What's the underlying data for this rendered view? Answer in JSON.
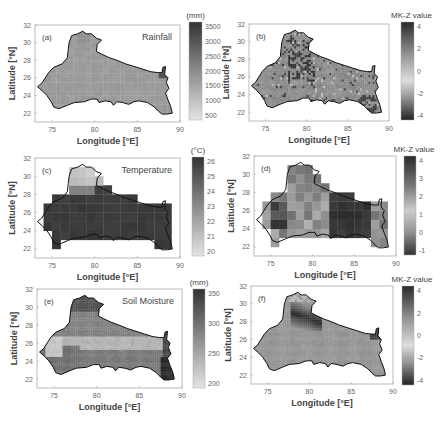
{
  "figure": {
    "layout": "3 rows x 2 columns",
    "x_ticks": [
      "75",
      "80",
      "85",
      "90"
    ],
    "y_ticks": [
      "32",
      "30",
      "28",
      "26",
      "24",
      "22"
    ],
    "xlabel": "Longitude [°E]",
    "ylabel": "Latitude [°N]"
  },
  "chart_data": [
    {
      "type": "heatmap",
      "panel": "(a)",
      "title": "Rainfall",
      "xlabel": "Longitude [°E]",
      "ylabel": "Latitude [°N]",
      "xlim": [
        73,
        90
      ],
      "ylim": [
        21,
        32
      ],
      "colorbar": {
        "label": "(mm)",
        "ticks": [
          "3500",
          "3000",
          "2500",
          "2000",
          "1500",
          "1000",
          "500"
        ],
        "range": [
          500,
          3500
        ]
      },
      "description": "Mean rainfall mostly ~1000–1500 mm across basin; higher values (~2500–3500 mm) in northeastern corner near 88°E, 27°N"
    },
    {
      "type": "heatmap",
      "panel": "(b)",
      "title": "",
      "xlabel": "Longitude [°E]",
      "ylabel": "Latitude [°N]",
      "xlim": [
        73,
        90
      ],
      "ylim": [
        21,
        32
      ],
      "colorbar": {
        "label": "MK-Z value",
        "ticks": [
          "4",
          "2",
          "0",
          "-2",
          "-4"
        ],
        "range": [
          -5,
          4.5
        ]
      },
      "description": "Rainfall trend: mostly near 0 (-1 to 1); scattered negative patches in central north (~78–81°E, 26–30°N) and southeast (~87°E, 23°N)"
    },
    {
      "type": "heatmap",
      "panel": "(c)",
      "title": "Temperature",
      "xlabel": "Longitude [°E]",
      "ylabel": "Latitude [°N]",
      "xlim": [
        73,
        90
      ],
      "ylim": [
        21,
        32
      ],
      "colorbar": {
        "label": "(°C)",
        "ticks": [
          "26",
          "25",
          "24",
          "23",
          "22",
          "21",
          "20"
        ],
        "range": [
          19.6,
          26.6
        ]
      },
      "description": "Coarse grid; ~25–26 °C across most of basin; cooler (~20–22 °C) in northern hills near 78–80°E, 29–31°N"
    },
    {
      "type": "heatmap",
      "panel": "(d)",
      "title": "",
      "xlabel": "Longitude [°E]",
      "ylabel": "Latitude [°N]",
      "xlim": [
        73,
        90
      ],
      "ylim": [
        21,
        32
      ],
      "colorbar": {
        "label": "MK-Z value",
        "ticks": [
          "4",
          "3",
          "2",
          "1",
          "0",
          "-1"
        ],
        "range": [
          -2,
          4.5
        ]
      },
      "description": "Temperature trend: strongly positive (3–4) in east (83–87°E, 23–28°N) and west (~75–77°E, 25–27°N); moderate (1–2) elsewhere"
    },
    {
      "type": "heatmap",
      "panel": "(e)",
      "title": "Soil Moisture",
      "xlabel": "Longitude [°E]",
      "ylabel": "Latitude [°N]",
      "xlim": [
        73,
        90
      ],
      "ylim": [
        21,
        32
      ],
      "colorbar": {
        "label": "(mm)",
        "ticks": [
          "350",
          "300",
          "250",
          "200"
        ],
        "range": [
          170,
          390
        ]
      },
      "description": "Higher soil moisture (300–390 mm) in northern hills and southeast corner; ~250–280 mm in south-central band; ~200 mm in west-central"
    },
    {
      "type": "heatmap",
      "panel": "(f)",
      "title": "",
      "xlabel": "Longitude [°E]",
      "ylabel": "Latitude [°N]",
      "xlim": [
        73,
        90
      ],
      "ylim": [
        21,
        32
      ],
      "colorbar": {
        "label": "MK-Z value",
        "ticks": [
          "4",
          "2",
          "0",
          "-2",
          "-4"
        ],
        "range": [
          -5.5,
          5
        ]
      },
      "description": "Soil moisture trend: mostly near 0; strongly negative (-4 to -5) band at northern foothills (~78–81°E, 27–30°N) and near 88°E, 26–27°N"
    }
  ],
  "panels": [
    {
      "id": "a",
      "letter": "(a)",
      "title": "Rainfall",
      "cb_label": "(mm)",
      "cb_ticks": [
        "3500",
        "3000",
        "2500",
        "2000",
        "1500",
        "1000",
        "500"
      ]
    },
    {
      "id": "b",
      "letter": "(b)",
      "title": "",
      "cb_label": "MK-Z value",
      "cb_ticks": [
        "4",
        "2",
        "0",
        "-2",
        "-4"
      ]
    },
    {
      "id": "c",
      "letter": "(c)",
      "title": "Temperature",
      "cb_label": "(°C)",
      "cb_ticks": [
        "26",
        "25",
        "24",
        "23",
        "22",
        "21",
        "20"
      ]
    },
    {
      "id": "d",
      "letter": "(d)",
      "title": "",
      "cb_label": "MK-Z value",
      "cb_ticks": [
        "4",
        "3",
        "2",
        "1",
        "0",
        "-1"
      ]
    },
    {
      "id": "e",
      "letter": "(e)",
      "title": "Soil Moisture",
      "cb_label": "(mm)",
      "cb_ticks": [
        "350",
        "300",
        "250",
        "200"
      ]
    },
    {
      "id": "f",
      "letter": "(f)",
      "title": "",
      "cb_label": "MK-Z value",
      "cb_ticks": [
        "4",
        "2",
        "0",
        "-2",
        "-4"
      ]
    }
  ]
}
